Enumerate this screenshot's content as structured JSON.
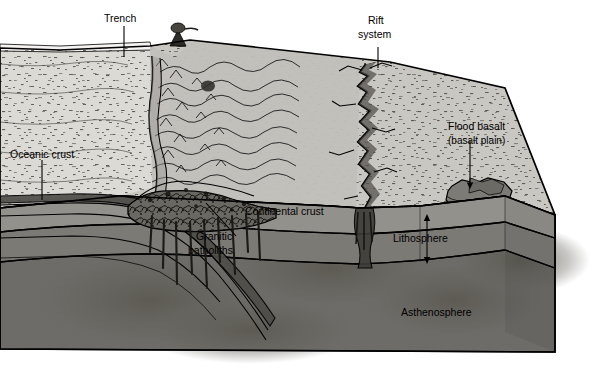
{
  "diagram": {
    "type": "geological-cross-section-block-diagram",
    "canvas": {
      "width": 602,
      "height": 368
    },
    "background_color": "#ffffff"
  },
  "labels": {
    "trench": "Trench",
    "rift_line1": "Rift",
    "rift_line2": "system",
    "oceanic_crust": "Oceanic crust",
    "flood_basalt_line1": "Flood basalt",
    "flood_basalt_line2": "(basalt plain)",
    "continental_crust": "Continental crust",
    "granitic_line1": "Granitic",
    "granitic_line2": "batholiths",
    "lithosphere": "Lithosphere",
    "asthenosphere": "Asthenosphere"
  },
  "colors": {
    "sea_surface": "#f2f2f0",
    "ocean_floor": "#d9d7d2",
    "continent_surface": "#c9c7c1",
    "crust_band": "#8f8d88",
    "lithosphere_band": "#7a7873",
    "asthenosphere": "#6e6c68",
    "batholith": "#5f5d58",
    "flood_basalt": "#8a8884",
    "outline": "#000000",
    "label_text": "#000000"
  },
  "features": [
    {
      "name": "oceanic-plate",
      "side": "left",
      "description": "oceanic crust subducting to the right"
    },
    {
      "name": "trench",
      "description": "deep linear depression at plate boundary"
    },
    {
      "name": "volcano",
      "description": "erupting volcano on mountain crest"
    },
    {
      "name": "mountain-range",
      "description": "folded mountain belt above subduction zone"
    },
    {
      "name": "rift-system",
      "description": "jagged extensional crack across continent"
    },
    {
      "name": "flood-basalt-plain",
      "description": "dark irregular basalt plain on continent"
    },
    {
      "name": "granitic-batholiths",
      "description": "intrusive bodies beneath mountain belt"
    },
    {
      "name": "lithosphere",
      "description": "rigid outer layer, thickness shown by arrow"
    },
    {
      "name": "asthenosphere",
      "description": "ductile mantle layer beneath lithosphere"
    }
  ]
}
